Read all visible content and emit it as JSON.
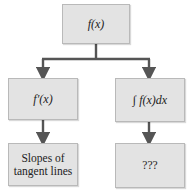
{
  "diagram": {
    "top": {
      "label": "f(x)"
    },
    "left_middle": {
      "label": "f′(x)"
    },
    "right_middle": {
      "label": "∫ f(x)dx"
    },
    "left_bottom": {
      "label": "Slopes of tangent lines"
    },
    "right_bottom": {
      "label": "???"
    }
  },
  "colors": {
    "box_fill": "#e3e3e3",
    "box_border": "#b9b9b9",
    "connector": "#555555"
  }
}
